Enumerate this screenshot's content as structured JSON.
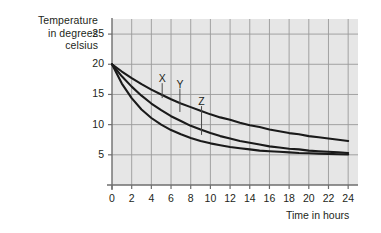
{
  "chart_data": {
    "type": "line",
    "title": "",
    "ylabel": "Temperature\nin degrees\ncelsius",
    "ylabel_lines": [
      "Temperature",
      "in degrees",
      "celsius"
    ],
    "xlabel": "Time in hours",
    "xlim": [
      0,
      25
    ],
    "ylim": [
      0,
      27.5
    ],
    "xticks": [
      0,
      2,
      4,
      6,
      8,
      10,
      12,
      14,
      16,
      18,
      20,
      22,
      24
    ],
    "yticks": [
      5,
      10,
      15,
      20,
      25
    ],
    "grid": true,
    "legend": "inline-annotations",
    "plot_bg": "#e6e6e6",
    "grid_color": "#9a9a9a",
    "axis_color": "#6e6e6e",
    "curve_color": "#1a1a1a",
    "annotations": [
      {
        "label": "X",
        "label_x": 5.1,
        "label_y": 17.2,
        "leader_to_x": 5.1,
        "leader_to_y": 14.4
      },
      {
        "label": "Y",
        "label_x": 6.9,
        "label_y": 16.3,
        "leader_to_x": 6.9,
        "leader_to_y": 12.1
      },
      {
        "label": "Z",
        "label_x": 9.1,
        "label_y": 13.4,
        "leader_to_x": 9.1,
        "leader_to_y": 8.3
      }
    ],
    "series": [
      {
        "name": "X",
        "description": "slowest cooling curve",
        "x": [
          0,
          1,
          2,
          3,
          4,
          5,
          6,
          7,
          8,
          9,
          10,
          11,
          12,
          13,
          14,
          15,
          16,
          17,
          18,
          19,
          20,
          21,
          22,
          23,
          24
        ],
        "values": [
          20.0,
          18.8,
          17.7,
          16.7,
          15.8,
          15.0,
          14.2,
          13.5,
          12.9,
          12.3,
          11.7,
          11.2,
          10.8,
          10.3,
          9.9,
          9.6,
          9.2,
          8.9,
          8.6,
          8.4,
          8.1,
          7.9,
          7.7,
          7.5,
          7.3
        ]
      },
      {
        "name": "Y",
        "description": "medium cooling curve",
        "x": [
          0,
          1,
          2,
          3,
          4,
          5,
          6,
          7,
          8,
          9,
          10,
          11,
          12,
          13,
          14,
          15,
          16,
          17,
          18,
          19,
          20,
          21,
          22,
          23,
          24
        ],
        "values": [
          20.0,
          18.0,
          16.3,
          14.8,
          13.5,
          12.4,
          11.4,
          10.6,
          9.8,
          9.2,
          8.6,
          8.1,
          7.7,
          7.3,
          7.0,
          6.7,
          6.4,
          6.2,
          6.0,
          5.9,
          5.7,
          5.6,
          5.5,
          5.4,
          5.3
        ]
      },
      {
        "name": "Z",
        "description": "fastest cooling curve",
        "x": [
          0,
          1,
          2,
          3,
          4,
          5,
          6,
          7,
          8,
          9,
          10,
          11,
          12,
          13,
          14,
          15,
          16,
          17,
          18,
          19,
          20,
          21,
          22,
          23,
          24
        ],
        "values": [
          20.0,
          16.8,
          14.4,
          12.5,
          11.1,
          10.0,
          9.1,
          8.4,
          7.8,
          7.3,
          6.9,
          6.6,
          6.3,
          6.1,
          5.9,
          5.7,
          5.6,
          5.5,
          5.4,
          5.3,
          5.25,
          5.2,
          5.15,
          5.1,
          5.05
        ]
      }
    ],
    "asymptote": 5
  }
}
